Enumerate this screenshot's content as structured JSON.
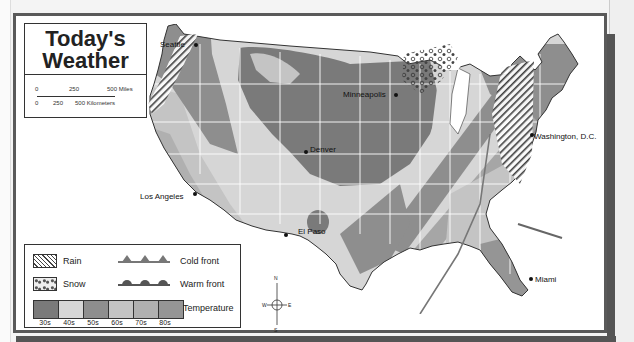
{
  "title": {
    "line1": "Today's",
    "line2": "Weather"
  },
  "scale": {
    "miles_labels": [
      "0",
      "250",
      "500 Miles"
    ],
    "km_labels": [
      "0",
      "250",
      "500 Kilometers"
    ]
  },
  "legend": {
    "rain": "Rain",
    "snow": "Snow",
    "cold_front": "Cold front",
    "warm_front": "Warm front",
    "temperature": "Temperature",
    "temperature_bands": [
      {
        "label": "30s",
        "color": "#7a7a7a"
      },
      {
        "label": "40s",
        "color": "#d6d6d6"
      },
      {
        "label": "50s",
        "color": "#8e8e8e"
      },
      {
        "label": "60s",
        "color": "#c4c4c4"
      },
      {
        "label": "70s",
        "color": "#b0b0b0"
      },
      {
        "label": "80s",
        "color": "#959595"
      }
    ]
  },
  "cities": [
    {
      "name": "Seattle"
    },
    {
      "name": "Minneapolis"
    },
    {
      "name": "Denver"
    },
    {
      "name": "Washington, D.C."
    },
    {
      "name": "Los Angeles"
    },
    {
      "name": "El Paso"
    },
    {
      "name": "Miami"
    }
  ],
  "compass": {
    "n": "N",
    "s": "S",
    "e": "E",
    "w": "W"
  },
  "colors": {
    "frame": "#5a5a5a",
    "outline": "#333333",
    "state_border": "#ffffff"
  }
}
